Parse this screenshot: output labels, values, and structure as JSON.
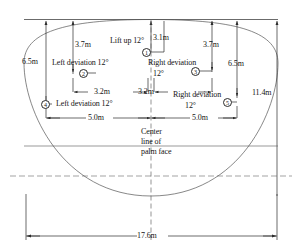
{
  "diagram": {
    "center_note": "Center line of palm face",
    "overall_width": "17.6m",
    "overall_height": "11.4m",
    "markers": [
      {
        "id": "1",
        "label": "1"
      },
      {
        "id": "2",
        "label": "2"
      },
      {
        "id": "3",
        "label": "3"
      },
      {
        "id": "4",
        "label": "4"
      },
      {
        "id": "5",
        "label": "5"
      }
    ],
    "annotations": [
      {
        "name": "lift-up-angle",
        "text": "Lift up 12°"
      },
      {
        "name": "left-deviation-upper",
        "text": "Left deviation 12°"
      },
      {
        "name": "right-deviation-upper",
        "text": "Right deviation"
      },
      {
        "name": "right-deviation-upper-angle",
        "text": "12°"
      },
      {
        "name": "left-deviation-lower",
        "text": "Left deviation 12°"
      },
      {
        "name": "right-deviation-lower",
        "text": "Right deviation"
      },
      {
        "name": "right-deviation-lower-angle",
        "text": "12°"
      }
    ],
    "dimensions": {
      "vertical_left_outer": "6.5m",
      "vertical_left_inner": "3.7m",
      "vertical_center": "3.1m",
      "vertical_right_inner": "3.7m",
      "vertical_right_outer": "6.5m",
      "vertical_far_right": "11.4m",
      "horizontal_inner_left": "3.2m",
      "horizontal_inner_right": "3.2m",
      "horizontal_outer_left": "5.0m",
      "horizontal_outer_right": "5.0m",
      "horizontal_total": "17.6m"
    },
    "colors": {
      "line": "#2b2b2b",
      "curve": "#555555",
      "dashed": "#666666",
      "text": "#141414",
      "background": "#ffffff"
    }
  }
}
